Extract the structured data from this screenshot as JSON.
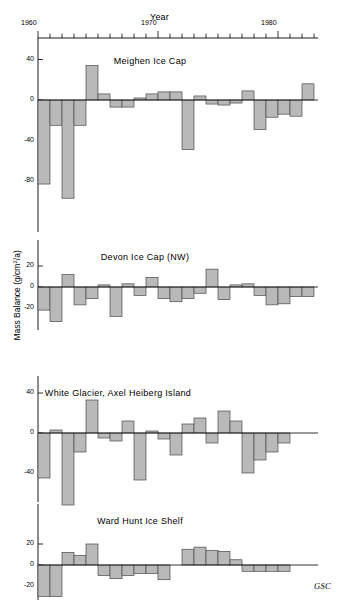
{
  "figure": {
    "xaxis_title": "Year",
    "yaxis_title_text": "Mass Balance (g/cm",
    "yaxis_title_sup": "2",
    "yaxis_title_tail": "/a)",
    "credit": "GSC",
    "xtick_labels": [
      "1960",
      "1970",
      "1980"
    ],
    "xtick_years": [
      1960,
      1970,
      1980
    ]
  },
  "chart_data": {
    "type": "bar",
    "xlabel": "Year",
    "ylabel": "Mass Balance (g/cm2/a)",
    "grid": false,
    "legend": false,
    "xlim": [
      1959.5,
      1983.5
    ],
    "xtick_labels": [
      "1960",
      "1970",
      "1980"
    ],
    "xtick_values": [
      1960,
      1970,
      1980
    ],
    "x_minor_tick_interval": 1,
    "panels": [
      {
        "name": "Meighen Ice Cap",
        "ylabel_ticks": [
          "40",
          "0",
          "-40",
          "-80"
        ],
        "ytick_values": [
          40,
          0,
          -40,
          -80
        ],
        "ylim": [
          -100,
          48
        ],
        "years": [
          1960,
          1961,
          1962,
          1963,
          1964,
          1965,
          1966,
          1967,
          1968,
          1969,
          1970,
          1971,
          1972,
          1973,
          1974,
          1975,
          1976,
          1977,
          1978,
          1979,
          1980,
          1981,
          1982
        ],
        "values": [
          -83,
          -25,
          -97,
          -25,
          34,
          6,
          -7,
          -7,
          2,
          6,
          8,
          8,
          -49,
          4,
          -4,
          -5,
          -3,
          9,
          -29,
          -17,
          -14,
          -16,
          16
        ]
      },
      {
        "name": "Devon Ice Cap (NW)",
        "ylabel_ticks": [
          "20",
          "0",
          "-20"
        ],
        "ytick_values": [
          20,
          0,
          -20
        ],
        "ylim": [
          -36,
          26
        ],
        "years": [
          1960,
          1961,
          1962,
          1963,
          1964,
          1965,
          1966,
          1967,
          1968,
          1969,
          1970,
          1971,
          1972,
          1973,
          1974,
          1975,
          1976,
          1977,
          1978,
          1979,
          1980,
          1981,
          1982
        ],
        "values": [
          -22,
          -33,
          12,
          -17,
          -11,
          2,
          -28,
          3,
          -8,
          9,
          -11,
          -14,
          -11,
          -6,
          17,
          -12,
          2,
          3,
          -8,
          -17,
          -16,
          -9,
          -9
        ]
      },
      {
        "name": "White Glacier, Axel Heiberg Island",
        "ylabel_ticks": [
          "40",
          "0",
          "-40"
        ],
        "ytick_values": [
          40,
          0,
          -40
        ],
        "ylim": [
          -78,
          50
        ],
        "years": [
          1960,
          1961,
          1962,
          1963,
          1964,
          1965,
          1966,
          1967,
          1968,
          1969,
          1970,
          1971,
          1972,
          1973,
          1974,
          1975,
          1976,
          1977,
          1978,
          1979,
          1980,
          1981,
          1982
        ],
        "values": [
          -45,
          3,
          -72,
          -19,
          33,
          -5,
          -8,
          12,
          -47,
          2,
          -6,
          -22,
          9,
          15,
          -10,
          22,
          12,
          -40,
          -27,
          -19,
          -10,
          0,
          0
        ]
      },
      {
        "name": "Ward Hunt Ice Shelf",
        "ylabel_ticks": [
          "20",
          "0",
          "-20"
        ],
        "ytick_values": [
          20,
          0,
          -20
        ],
        "ylim": [
          -38,
          26
        ],
        "years": [
          1960,
          1961,
          1962,
          1963,
          1964,
          1965,
          1966,
          1967,
          1968,
          1969,
          1970,
          1971,
          1972,
          1973,
          1974,
          1975,
          1976,
          1977,
          1978,
          1979,
          1980,
          1981,
          1982
        ],
        "values": [
          -30,
          -30,
          12,
          9,
          20,
          -10,
          -13,
          -10,
          -8,
          -8,
          -14,
          0,
          15,
          17,
          14,
          13,
          5,
          -6,
          -6,
          -6,
          -6,
          0,
          0
        ]
      }
    ]
  }
}
